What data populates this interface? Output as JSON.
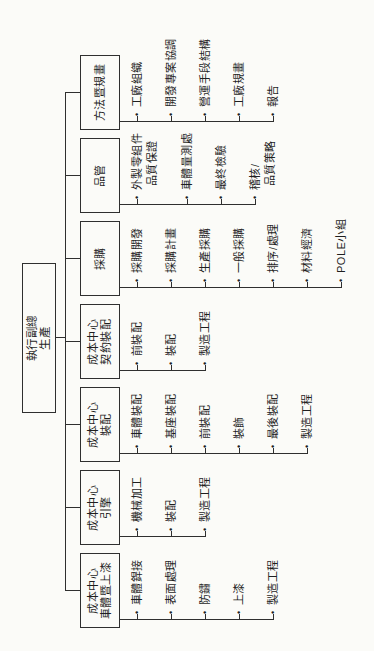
{
  "root": {
    "line1": "執行副總",
    "line2": "生產"
  },
  "bullet": "•",
  "branches": [
    {
      "title": [
        "成本中心",
        "車體暨上漆"
      ],
      "items": [
        [
          "車體銲接"
        ],
        [
          "表面處理"
        ],
        [
          "防鏽"
        ],
        [
          "上漆"
        ],
        [
          "製造工程"
        ]
      ]
    },
    {
      "title": [
        "成本中心",
        "引擎"
      ],
      "items": [
        [
          "機械加工"
        ],
        [
          "裝配"
        ],
        [
          "製造工程"
        ]
      ]
    },
    {
      "title": [
        "成本中心",
        "裝配"
      ],
      "items": [
        [
          "車體裝配"
        ],
        [
          "基座裝配"
        ],
        [
          "前裝配"
        ],
        [
          "裝飾"
        ],
        [
          "最後裝配"
        ],
        [
          "製造工程"
        ]
      ]
    },
    {
      "title": [
        "成本中心",
        "契約裝配"
      ],
      "items": [
        [
          "前裝配"
        ],
        [
          "裝配"
        ],
        [
          "製造工程"
        ]
      ]
    },
    {
      "title": [
        "採購"
      ],
      "items": [
        [
          "採購開發"
        ],
        [
          "採購計畫"
        ],
        [
          "生產採購"
        ],
        [
          "一般採購"
        ],
        [
          "排序/處理"
        ],
        [
          "材料經濟"
        ],
        [
          "POLE小組"
        ]
      ]
    },
    {
      "title": [
        "品管"
      ],
      "items": [
        [
          "外製零組件",
          "品質保證"
        ],
        [
          "車體量測處"
        ],
        [
          "最終檢驗"
        ],
        [
          "稽核/",
          "品質策略"
        ]
      ]
    },
    {
      "title": [
        "方法暨規畫"
      ],
      "items": [
        [
          "工廠組織"
        ],
        [
          "開發專案協調"
        ],
        [
          "營運手段結構"
        ],
        [
          "工廠規畫"
        ],
        [
          "報告"
        ]
      ]
    }
  ],
  "colors": {
    "line": "#2f2f2f",
    "background": "#fbfbf8",
    "text": "#1f1f1f"
  }
}
